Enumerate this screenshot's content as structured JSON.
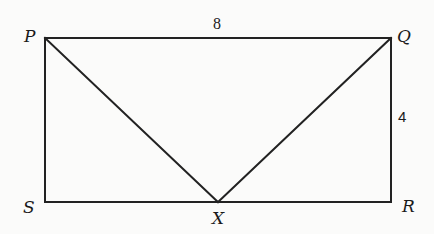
{
  "diagram": {
    "type": "geometry",
    "shape": "rectangle PQRS with triangle PXQ",
    "colors": {
      "line": "#222222",
      "text": "#1a1a1a",
      "background": "#fbfbfa"
    },
    "vertices": {
      "P": {
        "label": "P",
        "x": 45,
        "y": 38
      },
      "Q": {
        "label": "Q",
        "x": 391,
        "y": 38
      },
      "R": {
        "label": "R",
        "x": 391,
        "y": 202
      },
      "S": {
        "label": "S",
        "x": 45,
        "y": 202
      },
      "X": {
        "label": "X",
        "x": 218,
        "y": 202
      }
    },
    "edges": [
      {
        "from": "P",
        "to": "Q"
      },
      {
        "from": "Q",
        "to": "R"
      },
      {
        "from": "R",
        "to": "S"
      },
      {
        "from": "S",
        "to": "P"
      },
      {
        "from": "P",
        "to": "X"
      },
      {
        "from": "Q",
        "to": "X"
      }
    ],
    "measurements": {
      "PQ": {
        "label": "8",
        "side": "PQ"
      },
      "QR": {
        "label": "4",
        "side": "QR"
      }
    }
  }
}
